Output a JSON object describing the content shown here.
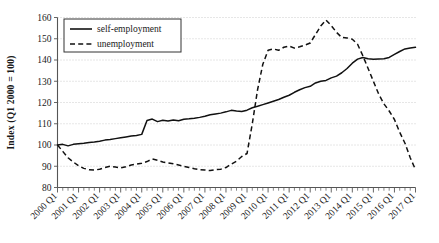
{
  "chart_data": {
    "type": "line",
    "title": "",
    "xlabel": "",
    "ylabel": "Index (Q1 2000 = 100)",
    "ylim": [
      80,
      160
    ],
    "yticks": [
      80,
      90,
      100,
      110,
      120,
      130,
      140,
      150,
      160
    ],
    "grid": true,
    "legend_position": "top-left",
    "x_tick_labels": [
      "2000 Q1",
      "2001 Q1",
      "2002 Q1",
      "2003 Q1",
      "2004 Q1",
      "2005 Q1",
      "2006 Q1",
      "2007 Q1",
      "2008 Q1",
      "2009 Q1",
      "2010 Q1",
      "2011 Q1",
      "2012 Q1",
      "2013 Q1",
      "2014 Q1",
      "2015 Q1",
      "2016 Q1",
      "2017 Q1"
    ],
    "x_quarters": [
      "2000 Q1",
      "2000 Q2",
      "2000 Q3",
      "2000 Q4",
      "2001 Q1",
      "2001 Q2",
      "2001 Q3",
      "2001 Q4",
      "2002 Q1",
      "2002 Q2",
      "2002 Q3",
      "2002 Q4",
      "2003 Q1",
      "2003 Q2",
      "2003 Q3",
      "2003 Q4",
      "2004 Q1",
      "2004 Q2",
      "2004 Q3",
      "2004 Q4",
      "2005 Q1",
      "2005 Q2",
      "2005 Q3",
      "2005 Q4",
      "2006 Q1",
      "2006 Q2",
      "2006 Q3",
      "2006 Q4",
      "2007 Q1",
      "2007 Q2",
      "2007 Q3",
      "2007 Q4",
      "2008 Q1",
      "2008 Q2",
      "2008 Q3",
      "2008 Q4",
      "2009 Q1",
      "2009 Q2",
      "2009 Q3",
      "2009 Q4",
      "2010 Q1",
      "2010 Q2",
      "2010 Q3",
      "2010 Q4",
      "2011 Q1",
      "2011 Q2",
      "2011 Q3",
      "2011 Q4",
      "2012 Q1",
      "2012 Q2",
      "2012 Q3",
      "2012 Q4",
      "2013 Q1",
      "2013 Q2",
      "2013 Q3",
      "2013 Q4",
      "2014 Q1",
      "2014 Q2",
      "2014 Q3",
      "2014 Q4",
      "2015 Q1",
      "2015 Q2",
      "2015 Q3",
      "2015 Q4",
      "2016 Q1",
      "2016 Q2",
      "2016 Q3",
      "2016 Q4",
      "2017 Q1"
    ],
    "series": [
      {
        "name": "self-employment",
        "style": "solid",
        "color": "#111111",
        "values": [
          100.0,
          100.3,
          99.6,
          100.3,
          100.6,
          100.8,
          101.2,
          101.4,
          101.8,
          102.3,
          102.6,
          103.0,
          103.4,
          103.8,
          104.2,
          104.5,
          105.0,
          111.5,
          112.2,
          111.0,
          111.6,
          111.3,
          111.8,
          111.4,
          112.1,
          112.3,
          112.6,
          113.0,
          113.5,
          114.2,
          114.6,
          115.0,
          115.6,
          116.3,
          116.0,
          115.8,
          116.4,
          117.5,
          118.2,
          119.0,
          119.8,
          120.6,
          121.4,
          122.5,
          123.4,
          124.8,
          126.0,
          127.0,
          127.6,
          129.2,
          130.0,
          130.4,
          131.6,
          132.4,
          134.0,
          136.0,
          138.5,
          140.4,
          141.2,
          140.6,
          140.4,
          140.5,
          140.6,
          141.2,
          142.6,
          144.0,
          145.2,
          145.6,
          146.0
        ]
      },
      {
        "name": "unemployment",
        "style": "dashed",
        "color": "#111111",
        "values": [
          100.0,
          97.0,
          94.0,
          92.0,
          90.2,
          89.0,
          88.4,
          88.2,
          88.6,
          89.4,
          90.0,
          89.6,
          89.2,
          89.8,
          90.6,
          91.0,
          91.4,
          92.2,
          93.4,
          92.8,
          92.0,
          91.6,
          91.2,
          90.6,
          90.0,
          89.4,
          88.8,
          88.4,
          88.2,
          88.0,
          88.4,
          88.6,
          89.4,
          91.0,
          92.4,
          94.6,
          96.0,
          110.0,
          126.0,
          138.0,
          144.6,
          145.2,
          144.6,
          146.0,
          146.6,
          145.6,
          146.2,
          147.0,
          148.0,
          152.0,
          156.0,
          158.8,
          156.2,
          153.0,
          150.6,
          150.4,
          149.8,
          147.4,
          142.0,
          136.0,
          130.0,
          124.0,
          119.4,
          116.0,
          112.0,
          106.0,
          100.8,
          94.0,
          88.4
        ]
      }
    ]
  },
  "legend": {
    "items": [
      {
        "label": "self-employment",
        "style": "solid"
      },
      {
        "label": "unemployment",
        "style": "dashed"
      }
    ]
  }
}
